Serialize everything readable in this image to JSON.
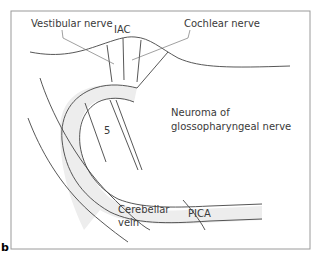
{
  "figure": {
    "panel_label": "b",
    "labels": {
      "vestibular_nerve": "Vestibular nerve",
      "iac": "IAC",
      "cochlear_nerve": "Cochlear nerve",
      "neuroma_line1": "Neuroma of",
      "neuroma_line2": "glossopharyngeal nerve",
      "cn5": "5",
      "pica": "PICA",
      "cerebellar_line1": "Cerebellar",
      "cerebellar_line2": "vein"
    },
    "colors": {
      "frame": "#9a9a9a",
      "stroke": "#444444",
      "vessel_fill": "#ededed",
      "text": "#3a3a3a"
    }
  }
}
